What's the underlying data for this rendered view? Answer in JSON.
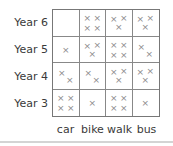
{
  "chart_data": {
    "type": "table",
    "title": "",
    "row_labels": [
      "Year 6",
      "Year 5",
      "Year 4",
      "Year 3"
    ],
    "column_labels": [
      "car",
      "bike",
      "walk",
      "bus"
    ],
    "values": [
      [
        0,
        4,
        3,
        3
      ],
      [
        1,
        3,
        4,
        2
      ],
      [
        2,
        2,
        3,
        3
      ],
      [
        4,
        1,
        4,
        1
      ]
    ],
    "symbol": "×",
    "xlabel": "",
    "ylabel": ""
  },
  "labels": {
    "rows": [
      "Year 6",
      "Year 5",
      "Year 4",
      "Year 3"
    ],
    "cols": [
      "car",
      "bike",
      "walk",
      "bus"
    ]
  },
  "symbol": "×"
}
